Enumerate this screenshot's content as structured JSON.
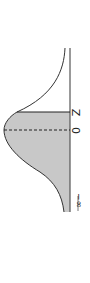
{
  "diagram": {
    "type": "normal-distribution-rotated",
    "labels": {
      "z": "Z",
      "mean": "0",
      "neg_inf": "−∞"
    },
    "colors": {
      "shade": "#c8c8c8",
      "line": "#333333",
      "axis": "#555555"
    }
  }
}
